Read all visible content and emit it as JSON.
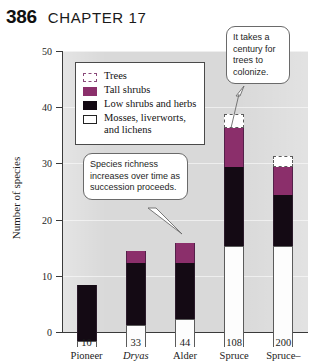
{
  "page": {
    "number": "386",
    "chapter": "CHAPTER 17"
  },
  "chart_data": {
    "type": "bar",
    "stacked": true,
    "title": "",
    "xlabel": "",
    "ylabel": "Number of species",
    "ylim": [
      0,
      50
    ],
    "yticks": [
      0,
      10,
      20,
      30,
      40,
      50
    ],
    "grid": false,
    "legend_position": "upper-left-inside",
    "categories": [
      "Pioneer",
      "Dryas",
      "Alder",
      "Spruce",
      "Spruce–"
    ],
    "category_years": [
      "10",
      "33",
      "44",
      "108",
      "200"
    ],
    "series": [
      {
        "name": "Mosses, liverworts, and lichens",
        "color": "#ffffff",
        "values": [
          1,
          4,
          5,
          18,
          18
        ]
      },
      {
        "name": "Low shrubs and herbs",
        "color": "#140a14",
        "values": [
          10,
          11,
          10,
          14,
          9
        ]
      },
      {
        "name": "Tall shrubs",
        "color": "#8b2f6b",
        "values": [
          0,
          2,
          3.5,
          7,
          5
        ]
      },
      {
        "name": "Trees",
        "color": "#ffffff",
        "values": [
          0,
          0,
          0,
          2.5,
          2
        ]
      }
    ],
    "totals": [
      11,
      17,
      18.5,
      41.5,
      34
    ]
  },
  "legend": {
    "items": [
      {
        "label": "Trees",
        "swatch": "trees-swatch"
      },
      {
        "label": "Tall shrubs",
        "swatch": "tall-shrubs-swatch"
      },
      {
        "label": "Low shrubs and herbs",
        "swatch": "low-shrubs-swatch"
      },
      {
        "label": "Mosses, liverworts,",
        "label2": "and lichens",
        "swatch": "mosses-swatch"
      }
    ]
  },
  "callouts": {
    "trees": "It takes a century for trees to colonize.",
    "richness": "Species richness increases over time as succession proceeds."
  },
  "colors": {
    "tall_shrubs": "#8b2f6b",
    "low_shrubs": "#140a14",
    "panel": "#d9d9d9",
    "axis": "#3a3a3a"
  }
}
